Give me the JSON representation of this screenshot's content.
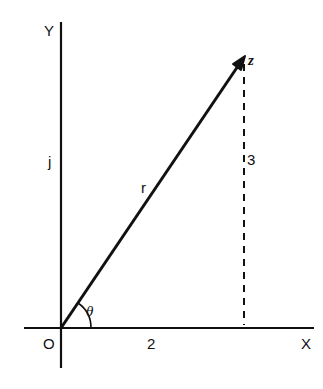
{
  "diagram": {
    "axes": {
      "x_label": "X",
      "y_label": "Y",
      "origin_label": "O"
    },
    "labels": {
      "imag_unit": "j",
      "vector": "r",
      "point": "z",
      "angle": "θ",
      "real_part": "2",
      "imag_part": "3"
    },
    "point_z": {
      "real": 2,
      "imag": 3
    },
    "colors": {
      "ink": "#111111",
      "background": "#ffffff"
    }
  }
}
